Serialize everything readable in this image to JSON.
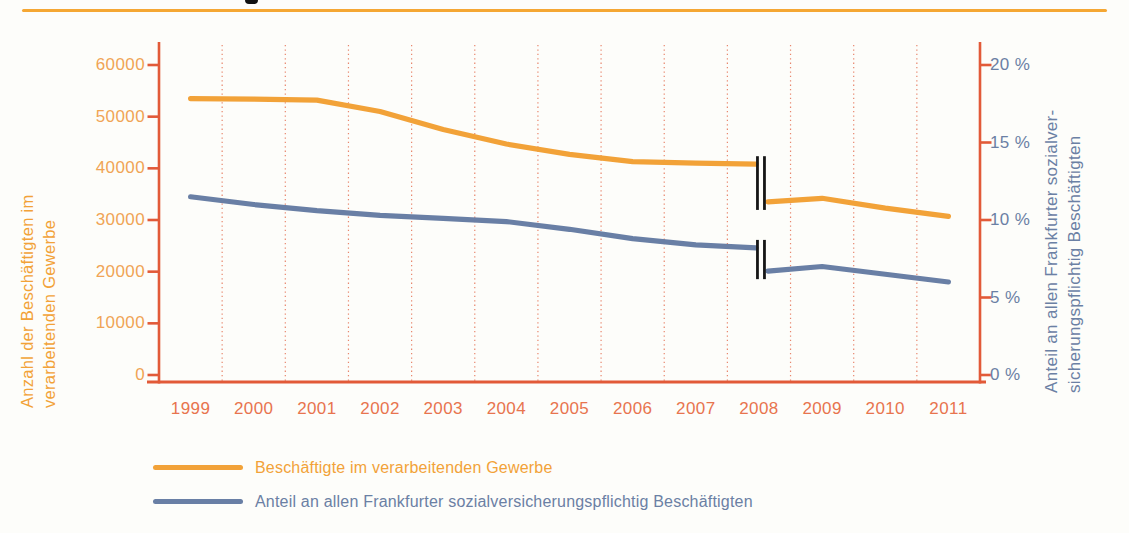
{
  "chart_data": {
    "type": "line",
    "x_categories": [
      "1999",
      "2000",
      "2001",
      "2002",
      "2003",
      "2004",
      "2005",
      "2006",
      "2007",
      "2008",
      "2009",
      "2010",
      "2011"
    ],
    "left_axis": {
      "title_lines": [
        "Anzahl der Beschäftigten im",
        "verarbeitenden Gewerbe"
      ],
      "range": [
        0,
        60000
      ],
      "ticks": [
        0,
        10000,
        20000,
        30000,
        40000,
        50000,
        60000
      ],
      "tick_labels": [
        "0",
        "10000",
        "20000",
        "30000",
        "40000",
        "50000",
        "60000"
      ]
    },
    "right_axis": {
      "title_lines": [
        "Anteil an allen Frankfurter sozialver-",
        "sicherungspflichtig Beschäftigten"
      ],
      "range": [
        0,
        20
      ],
      "ticks": [
        0,
        5,
        10,
        15,
        20
      ],
      "tick_labels": [
        "0 %",
        "5 %",
        "10 %",
        "15 %",
        "20 %"
      ]
    },
    "grid": "vertical-dotted-between-categories",
    "break_year": "2008",
    "series": [
      {
        "name": "Beschäftigte im verarbeitenden Gewerbe",
        "axis": "left",
        "color": "#F2A238",
        "segments": [
          {
            "years": [
              "1999",
              "2000",
              "2001",
              "2002",
              "2003",
              "2004",
              "2005",
              "2006",
              "2007",
              "2008"
            ],
            "values": [
              53500,
              53400,
              53200,
              51000,
              47500,
              44700,
              42700,
              41300,
              41000,
              40800
            ]
          },
          {
            "years": [
              "2008",
              "2009",
              "2010",
              "2011"
            ],
            "values": [
              33500,
              34200,
              32300,
              30700
            ]
          }
        ]
      },
      {
        "name": "Anteil an allen Frankfurter sozialversicherungspflichtig Beschäftigten",
        "axis": "right",
        "color": "#697FA5",
        "segments": [
          {
            "years": [
              "1999",
              "2000",
              "2001",
              "2002",
              "2003",
              "2004",
              "2005",
              "2006",
              "2007",
              "2008"
            ],
            "values": [
              11.5,
              11.0,
              10.6,
              10.3,
              10.1,
              9.9,
              9.4,
              8.8,
              8.4,
              8.2
            ]
          },
          {
            "years": [
              "2008",
              "2009",
              "2010",
              "2011"
            ],
            "values": [
              6.7,
              7.0,
              6.5,
              6.0
            ]
          }
        ]
      }
    ],
    "legend": [
      {
        "label": "Beschäftigte im verarbeitenden Gewerbe",
        "color": "#F2A238"
      },
      {
        "label": "Anteil an allen Frankfurter sozialversicherungspflichtig Beschäftigten",
        "color": "#697FA5"
      }
    ]
  },
  "colors": {
    "top_rule": "#F5A733",
    "axis": "#E25A38",
    "gridline": "#E4694A",
    "year_label": "#E8744E",
    "left_tick_label": "#F0A455",
    "right_tick_label": "#6B80A4",
    "break_marker": "#161616"
  }
}
